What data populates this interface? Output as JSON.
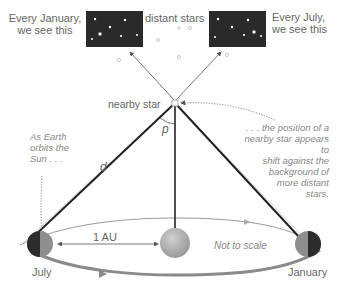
{
  "labels": {
    "january_view": [
      "Every January,",
      "we see this"
    ],
    "distant_stars": "distant stars",
    "july_view": [
      "Every July,",
      "we see this"
    ],
    "nearby_star": "nearby star",
    "parallax_angle": "p",
    "distance": "d",
    "earth_orbit_note": [
      "As Earth",
      "orbits the",
      "Sun . . ."
    ],
    "shift_note": [
      ". . . the position of a",
      "nearby star appears to",
      "shift against the",
      "background of",
      "more distant",
      "stars."
    ],
    "au": "1 AU",
    "scale_note": "Not to scale",
    "july": "July",
    "january": "January"
  },
  "colors": {
    "sky_box": "#2a2a2a",
    "line": "#444444",
    "orbit": "#888888",
    "sun": "#b5b5b5",
    "text": "#666666"
  }
}
